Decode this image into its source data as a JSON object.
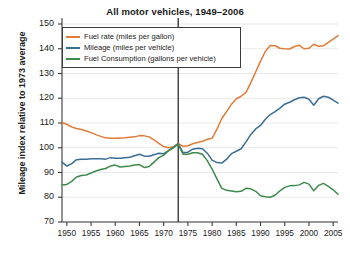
{
  "chart_data": {
    "type": "line",
    "title": "All motor vehicles, 1949–2006",
    "xlabel": "",
    "ylabel": "Mileage index relative to 1973 average",
    "xlim": [
      1949,
      2006
    ],
    "ylim": [
      70,
      150
    ],
    "ytick_labels": [
      "70",
      "80",
      "90",
      "100",
      "110",
      "120",
      "130",
      "140",
      "150"
    ],
    "yticks": [
      70,
      80,
      90,
      100,
      110,
      120,
      130,
      140,
      150
    ],
    "xtick_labels": [
      "1950",
      "1955",
      "1960",
      "1965",
      "1970",
      "1975",
      "1980",
      "1985",
      "1990",
      "1995",
      "2000",
      "2005"
    ],
    "xticks": [
      1950,
      1955,
      1960,
      1965,
      1970,
      1975,
      1980,
      1985,
      1990,
      1995,
      2000,
      2005
    ],
    "grid": "horizontal",
    "legend_position": "upper-left-inside",
    "reference_line": {
      "x": 1973,
      "label": "1973",
      "color": "#1a1a1a"
    },
    "x": [
      1949,
      1950,
      1951,
      1952,
      1953,
      1954,
      1955,
      1956,
      1957,
      1958,
      1959,
      1960,
      1961,
      1962,
      1963,
      1964,
      1965,
      1966,
      1967,
      1968,
      1969,
      1970,
      1971,
      1972,
      1973,
      1974,
      1975,
      1976,
      1977,
      1978,
      1979,
      1980,
      1981,
      1982,
      1983,
      1984,
      1985,
      1986,
      1987,
      1988,
      1989,
      1990,
      1991,
      1992,
      1993,
      1994,
      1995,
      1996,
      1997,
      1998,
      1999,
      2000,
      2001,
      2002,
      2003,
      2004,
      2005,
      2006
    ],
    "series": [
      {
        "name": "Fuel rate (miles per gallon)",
        "color": "#E07B39",
        "values": [
          110.2,
          109.5,
          108.4,
          107.8,
          107.4,
          106.8,
          106.1,
          105.3,
          104.6,
          104.0,
          103.8,
          103.8,
          103.9,
          104.0,
          104.2,
          104.4,
          104.9,
          104.8,
          104.4,
          103.2,
          101.8,
          100.5,
          100.0,
          100.4,
          101.8,
          100.6,
          100.8,
          101.6,
          102.1,
          102.6,
          103.4,
          103.8,
          107.5,
          111.8,
          114.6,
          117.6,
          119.8,
          120.8,
          122.4,
          126.3,
          130.6,
          135.0,
          139.0,
          141.3,
          141.2,
          140.2,
          140.0,
          139.9,
          140.9,
          141.4,
          140.0,
          140.2,
          141.8,
          141.0,
          141.2,
          142.6,
          143.9,
          145.3
        ]
      },
      {
        "name": "Mileage (miles per vehicle)",
        "color": "#3B6E93",
        "values": [
          94.2,
          92.6,
          93.6,
          95.2,
          95.4,
          95.4,
          95.6,
          95.6,
          95.6,
          95.4,
          96.0,
          95.8,
          95.8,
          96.0,
          96.2,
          96.8,
          97.4,
          96.6,
          96.6,
          97.2,
          97.8,
          97.6,
          98.8,
          100.2,
          101.6,
          98.0,
          98.2,
          99.4,
          99.8,
          99.6,
          97.8,
          95.0,
          94.0,
          93.8,
          95.4,
          97.6,
          98.6,
          99.6,
          102.4,
          105.4,
          107.6,
          109.0,
          111.5,
          113.4,
          114.6,
          116.0,
          117.6,
          118.4,
          119.4,
          120.2,
          120.4,
          119.6,
          117.2,
          119.8,
          120.8,
          120.4,
          119.2,
          118.0
        ]
      },
      {
        "name": "Fuel Consumption (gallons per vehicle)",
        "color": "#3C8A4E",
        "values": [
          85.0,
          85.2,
          86.4,
          88.2,
          88.8,
          89.0,
          89.8,
          90.6,
          91.2,
          91.6,
          92.6,
          93.0,
          92.2,
          92.4,
          92.6,
          93.0,
          93.2,
          92.0,
          92.4,
          94.2,
          96.0,
          97.0,
          98.8,
          100.0,
          101.4,
          97.4,
          97.4,
          98.0,
          98.0,
          97.4,
          94.8,
          91.4,
          87.4,
          83.6,
          82.8,
          82.5,
          82.2,
          82.4,
          83.6,
          83.4,
          82.4,
          80.6,
          80.2,
          80.0,
          80.8,
          82.6,
          84.0,
          84.6,
          84.7,
          85.0,
          86.0,
          85.3,
          82.6,
          84.8,
          85.6,
          84.4,
          83.0,
          81.2
        ]
      }
    ]
  }
}
